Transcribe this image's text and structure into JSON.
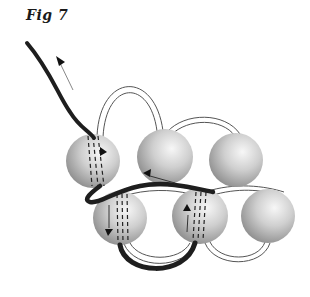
{
  "figure": {
    "label": "Fig 7",
    "colors": {
      "background": "#ffffff",
      "thread_dark": "#1e1e1e",
      "thread_outline": "#555555",
      "bead_light": "#f4f4f4",
      "bead_mid": "#c4c4c4",
      "bead_dark": "#8a8a8a",
      "arrow": "#111111"
    },
    "beads": [
      {
        "id": "top-1",
        "row": "top",
        "cx": 93,
        "cy": 161,
        "r": 27
      },
      {
        "id": "top-2",
        "row": "top",
        "cx": 165,
        "cy": 157,
        "r": 28
      },
      {
        "id": "top-3",
        "row": "top",
        "cx": 236,
        "cy": 160,
        "r": 27
      },
      {
        "id": "bottom-1",
        "row": "bottom",
        "cx": 120,
        "cy": 218,
        "r": 27
      },
      {
        "id": "bottom-2",
        "row": "bottom",
        "cx": 200,
        "cy": 216,
        "r": 28
      },
      {
        "id": "bottom-3",
        "row": "bottom",
        "cx": 268,
        "cy": 216,
        "r": 27
      }
    ],
    "arrows": [
      {
        "id": "exit-arrow",
        "direction": "up-left"
      },
      {
        "id": "top-1-arrow",
        "direction": "right"
      },
      {
        "id": "top-2-arrow",
        "direction": "left"
      },
      {
        "id": "bottom-1-arrow",
        "direction": "down"
      },
      {
        "id": "bottom-2-arrow",
        "direction": "up"
      }
    ]
  }
}
